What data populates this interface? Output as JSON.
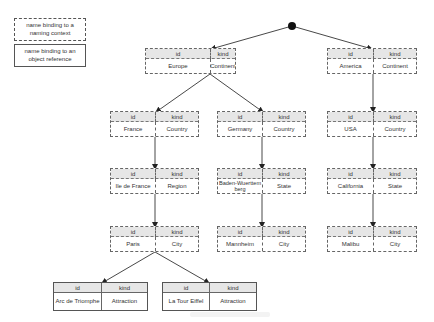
{
  "legend": {
    "naming_context": "name binding to a naming context",
    "object_reference": "name binding to an object reference"
  },
  "columns": {
    "id": "id",
    "kind": "kind"
  },
  "root": {
    "label": "root-naming-context",
    "color": "#000000"
  },
  "nodes": [
    {
      "key": "europe",
      "id": "Europe",
      "kind": "Continent",
      "type": "naming-context"
    },
    {
      "key": "america",
      "id": "America",
      "kind": "Continent",
      "type": "naming-context"
    },
    {
      "key": "france",
      "id": "France",
      "kind": "Country",
      "type": "naming-context"
    },
    {
      "key": "germany",
      "id": "Germany",
      "kind": "Country",
      "type": "naming-context"
    },
    {
      "key": "usa",
      "id": "USA",
      "kind": "Country",
      "type": "naming-context"
    },
    {
      "key": "ile-de-france",
      "id": "Ile de France",
      "kind": "Region",
      "type": "naming-context"
    },
    {
      "key": "baden-wuerttemberg",
      "id": "Baden-Wuerttemberg",
      "kind": "State",
      "type": "naming-context"
    },
    {
      "key": "california",
      "id": "California",
      "kind": "State",
      "type": "naming-context"
    },
    {
      "key": "paris",
      "id": "Paris",
      "kind": "City",
      "type": "naming-context"
    },
    {
      "key": "mannheim",
      "id": "Mannheim",
      "kind": "City",
      "type": "naming-context"
    },
    {
      "key": "malibu",
      "id": "Malibu",
      "kind": "City",
      "type": "naming-context"
    },
    {
      "key": "arc-de-triomphe",
      "id": "Arc de Triomphe",
      "kind": "Attraction",
      "type": "object-reference"
    },
    {
      "key": "la-tour-eiffel",
      "id": "La Tour Eiffel",
      "kind": "Attraction",
      "type": "object-reference"
    }
  ],
  "edges": [
    [
      "root",
      "europe"
    ],
    [
      "root",
      "america"
    ],
    [
      "europe",
      "france"
    ],
    [
      "europe",
      "germany"
    ],
    [
      "america",
      "usa"
    ],
    [
      "france",
      "ile-de-france"
    ],
    [
      "germany",
      "baden-wuerttemberg"
    ],
    [
      "usa",
      "california"
    ],
    [
      "ile-de-france",
      "paris"
    ],
    [
      "baden-wuerttemberg",
      "mannheim"
    ],
    [
      "california",
      "malibu"
    ],
    [
      "paris",
      "arc-de-triomphe"
    ],
    [
      "paris",
      "la-tour-eiffel"
    ]
  ],
  "colors": {
    "header_fill": "#e6e6e6",
    "line": "#333333",
    "border": "#666666"
  }
}
